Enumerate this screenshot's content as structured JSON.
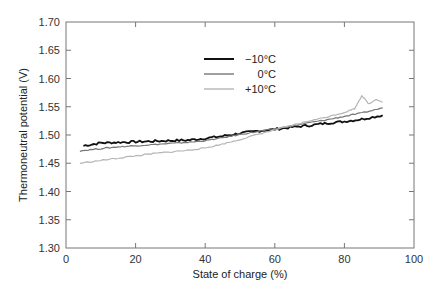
{
  "chart_data": {
    "type": "line",
    "title": "",
    "xlabel": "State of charge (%)",
    "ylabel": "Thermoneutral potential (V)",
    "xlim": [
      0,
      100
    ],
    "ylim": [
      1.3,
      1.7
    ],
    "xticks": [
      0,
      20,
      40,
      60,
      80,
      100
    ],
    "xtick_labels": [
      "0",
      "20",
      "40",
      "60",
      "80",
      "100"
    ],
    "yticks": [
      1.3,
      1.35,
      1.4,
      1.45,
      1.5,
      1.55,
      1.6,
      1.65,
      1.7
    ],
    "ytick_labels": [
      "1.30",
      "1.35",
      "1.40",
      "1.45",
      "1.50",
      "1.55",
      "1.60",
      "1.65",
      "1.70"
    ],
    "grid": false,
    "legend_position": "top-center",
    "series": [
      {
        "name": "−10°C",
        "color": "#111111",
        "x": [
          5,
          10,
          15,
          20,
          25,
          30,
          35,
          40,
          45,
          50,
          55,
          60,
          65,
          70,
          75,
          80,
          85,
          91
        ],
        "y": [
          1.481,
          1.486,
          1.487,
          1.488,
          1.489,
          1.49,
          1.491,
          1.494,
          1.498,
          1.503,
          1.507,
          1.51,
          1.514,
          1.517,
          1.521,
          1.524,
          1.528,
          1.535
        ]
      },
      {
        "name": "0°C",
        "color": "#777777",
        "x": [
          4,
          10,
          15,
          20,
          25,
          30,
          35,
          40,
          45,
          50,
          55,
          60,
          65,
          70,
          75,
          80,
          85,
          91
        ],
        "y": [
          1.472,
          1.476,
          1.479,
          1.481,
          1.483,
          1.485,
          1.487,
          1.49,
          1.495,
          1.501,
          1.506,
          1.511,
          1.516,
          1.522,
          1.527,
          1.533,
          1.539,
          1.548
        ]
      },
      {
        "name": "+10°C",
        "color": "#b5b5b5",
        "x": [
          4,
          10,
          15,
          20,
          25,
          30,
          35,
          40,
          45,
          50,
          55,
          60,
          65,
          70,
          75,
          80,
          83,
          85,
          87,
          89,
          91
        ],
        "y": [
          1.45,
          1.455,
          1.459,
          1.463,
          1.467,
          1.47,
          1.473,
          1.477,
          1.484,
          1.492,
          1.501,
          1.509,
          1.517,
          1.525,
          1.532,
          1.54,
          1.547,
          1.57,
          1.555,
          1.563,
          1.558
        ]
      }
    ]
  }
}
